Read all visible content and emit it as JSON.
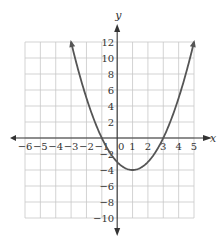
{
  "chart_data": {
    "type": "line",
    "title": "",
    "xlabel": "x",
    "ylabel": "y",
    "xlim": [
      -6,
      5
    ],
    "ylim": [
      -10,
      12
    ],
    "grid": true,
    "x_ticks": [
      -6,
      -5,
      -4,
      -3,
      -2,
      -1,
      0,
      1,
      2,
      3,
      4,
      5
    ],
    "x_tick_labels": [
      "−6",
      "−5",
      "−4",
      "−3",
      "−2",
      "−1",
      "0",
      "1",
      "2",
      "3",
      "4",
      "5"
    ],
    "y_ticks": [
      12,
      10,
      8,
      6,
      4,
      2,
      -2,
      -4,
      -6,
      -8,
      -10
    ],
    "y_tick_labels": [
      "12",
      "10",
      "8",
      "6",
      "4",
      "2",
      "−2",
      "−4",
      "−6",
      "−8",
      "−10"
    ],
    "series": [
      {
        "name": "parabola",
        "equation": "y = x^2 - 2x - 3",
        "x": [
          -3,
          -2,
          -1,
          0,
          1,
          2,
          3,
          4,
          5
        ],
        "y": [
          12,
          5,
          0,
          -3,
          -4,
          -3,
          0,
          5,
          12
        ],
        "color": "#555555",
        "arrows_at_ends": true
      }
    ],
    "key_points": {
      "vertex": [
        1,
        -4
      ],
      "x_intercepts": [
        -1,
        3
      ],
      "y_intercept": -3
    }
  },
  "colors": {
    "grid": "#c8c8c8",
    "axis": "#333333",
    "curve": "#555555"
  }
}
